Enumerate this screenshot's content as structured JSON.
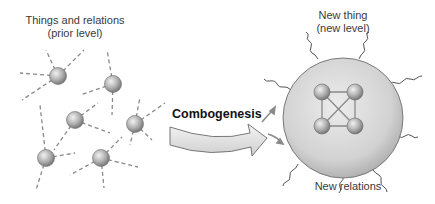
{
  "labels": {
    "prior_title_line1": "Things and relations",
    "prior_title_line2": "(prior level)",
    "process": "Combogenesis",
    "new_thing_line1": "New thing",
    "new_thing_line2": "(new level)",
    "new_relations": "New relations"
  },
  "colors": {
    "sphere_light": "#e6e6e6",
    "sphere_dark": "#7d7d7d",
    "dashed_line": "#8a8a8a",
    "arrow_fill": "#e9e9e9",
    "arrow_stroke": "#777777",
    "big_sphere_fill": "#d6d6d6"
  }
}
